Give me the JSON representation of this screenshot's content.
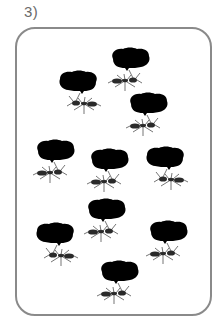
{
  "problem": {
    "number_label": "3)"
  },
  "frame": {
    "border_color": "#8a8a8a",
    "leaf_color": "#000000",
    "ant_color": "#2a2a2a"
  },
  "ants": [
    {
      "id": 1,
      "x": 107,
      "y": 47,
      "flip": false
    },
    {
      "id": 2,
      "x": 52,
      "y": 70,
      "flip": true
    },
    {
      "id": 3,
      "x": 125,
      "y": 92,
      "flip": false
    },
    {
      "id": 4,
      "x": 32,
      "y": 139,
      "flip": false
    },
    {
      "id": 5,
      "x": 86,
      "y": 148,
      "flip": false
    },
    {
      "id": 6,
      "x": 139,
      "y": 146,
      "flip": true
    },
    {
      "id": 7,
      "x": 83,
      "y": 198,
      "flip": false
    },
    {
      "id": 8,
      "x": 29,
      "y": 222,
      "flip": true
    },
    {
      "id": 9,
      "x": 145,
      "y": 220,
      "flip": false
    },
    {
      "id": 10,
      "x": 96,
      "y": 260,
      "flip": false
    }
  ],
  "ant_count": 10
}
